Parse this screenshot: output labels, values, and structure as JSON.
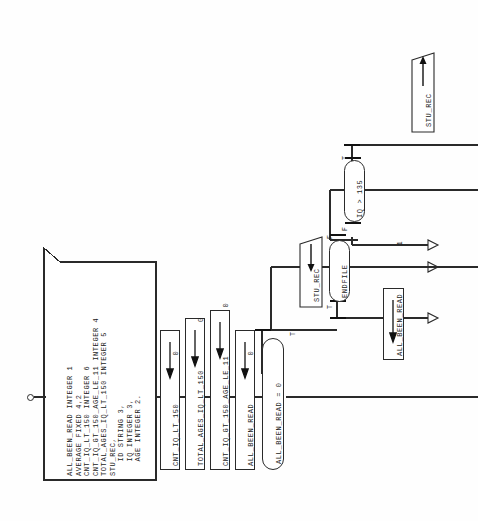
{
  "diagram": {
    "orientation": "rotated-90-ccw",
    "declaration_block": {
      "name": "declaration-box",
      "lines": [
        "ALL_BEEN_READ INTEGER 1",
        "AVERAGE FIXED 4,2",
        "CNT_IQ_LT_150 INTEGER 6",
        "CNT_IQ_GT_150_AGE_LE_11 INTEGER 4",
        "TOTAL_AGES_IQ_LT_150 INTEGER 5",
        "STU_REC,",
        "   ID STRING 3,",
        "   IQ INTEGER 3,",
        "   AGE INTEGER 2."
      ]
    },
    "start_node": {
      "name": "start-connector",
      "label": ""
    },
    "process_boxes": [
      {
        "name": "init-cnt-iq-lt-150",
        "label": "CNT_IQ_LT_150",
        "arrow": "←",
        "value": "0"
      },
      {
        "name": "init-total-ages-iq-lt-150",
        "label": "TOTAL_AGES_IQ_LT_150",
        "arrow": "←",
        "value": "0"
      },
      {
        "name": "init-cnt-iq-gt-150-age-le-11",
        "label": "CNT_IQ_GT_150_AGE_LE_11",
        "arrow": "←",
        "value": "0"
      },
      {
        "name": "init-all-been-read",
        "label": "ALL_BEEN_READ",
        "arrow": "←",
        "value": "0"
      },
      {
        "name": "set-all-been-read-1",
        "label": "ALL_BEEN_READ",
        "arrow": "←",
        "value": "1"
      }
    ],
    "decisions": [
      {
        "name": "decision-all-been-read",
        "condition": "ALL_BEEN_READ = 0",
        "true_label": "T",
        "false_label": ""
      },
      {
        "name": "decision-endfile",
        "condition": "ENDFILE",
        "true_label": "T",
        "false_label": "F"
      },
      {
        "name": "decision-iq-gt-135",
        "condition": "IQ > 135",
        "true_label": "T",
        "false_label": "F"
      }
    ],
    "io_blocks": [
      {
        "name": "io-read-stu-rec",
        "label": "STU_REC",
        "kind": "input"
      },
      {
        "name": "io-write-stu-rec",
        "label": "STU_REC",
        "kind": "output"
      }
    ],
    "connectors": [
      {
        "name": "connector-arrow-1",
        "glyph": "▷"
      },
      {
        "name": "connector-arrow-2",
        "glyph": "▷"
      },
      {
        "name": "connector-arrow-3",
        "glyph": "▷"
      }
    ],
    "ellipsis": "∶"
  }
}
